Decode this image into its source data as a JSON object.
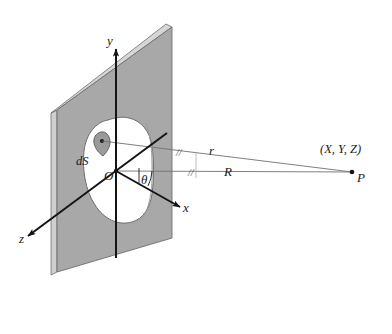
{
  "figure": {
    "kind": "physics-diagram",
    "background_color": "#ffffff"
  },
  "colors": {
    "plane_face": "#a8a8a8",
    "plane_edge_light": "#cfcfcf",
    "plane_outline": "#6e6e6e",
    "aperture_fill": "#ffffff",
    "aperture_outline": "#6e6e6e",
    "ds_fill": "#9a9a9a",
    "ds_outline": "#5a5a5a",
    "axis_stroke": "#141414",
    "ray_stroke": "#707070",
    "text": "#1a1a1a"
  },
  "axes": {
    "y": {
      "label": "y",
      "direction": "up"
    },
    "x": {
      "label": "x",
      "direction": "right-down"
    },
    "z": {
      "label": "z",
      "direction": "left-down"
    },
    "origin": {
      "label": "O"
    }
  },
  "plane": {
    "name": "opaque screen with aperture",
    "aperture_label": "aperture"
  },
  "elements": {
    "ds": {
      "label": "dS",
      "description": "differential surface element"
    }
  },
  "vectors": {
    "r": {
      "label": "r",
      "from": "dS",
      "to": "P",
      "tick": "//"
    },
    "R": {
      "label": "R",
      "from": "O",
      "to": "P",
      "tick": "//"
    }
  },
  "angles": {
    "theta": {
      "label": "θ",
      "between": "R and x-axis"
    }
  },
  "field_point": {
    "coords_label": "(X, Y, Z)",
    "point_label": "P"
  }
}
